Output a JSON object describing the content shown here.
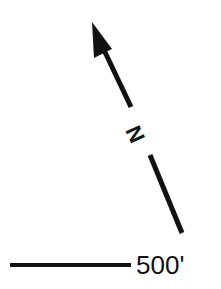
{
  "north_arrow": {
    "label": "N",
    "icon": "north-arrow-icon",
    "color": "#111111"
  },
  "scale": {
    "label": "500'",
    "color": "#111111"
  }
}
